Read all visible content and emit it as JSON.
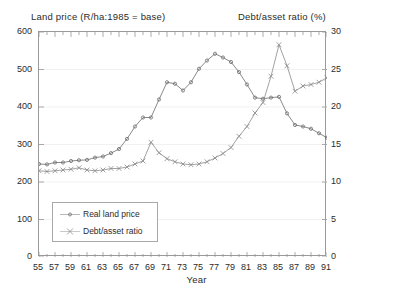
{
  "chart_data": {
    "type": "line",
    "title": "",
    "left_axis_title": "Land price (R/ha:1985 = base)",
    "right_axis_title": "Debt/asset ratio (%)",
    "xlabel": "Year",
    "ylabel": "Land price (R/ha:1985 = base)",
    "y2label": "Debt/asset ratio (%)",
    "ylim": [
      0,
      600
    ],
    "y2lim": [
      0,
      30
    ],
    "xlim": [
      55,
      91
    ],
    "grid": false,
    "legend_position": "lower-left-inside",
    "y_ticks": [
      "0",
      "100",
      "200",
      "300",
      "400",
      "500",
      "600"
    ],
    "y2_ticks": [
      "0",
      "5",
      "10",
      "15",
      "20",
      "25",
      "30"
    ],
    "x_ticks": [
      "55",
      "57",
      "59",
      "61",
      "63",
      "65",
      "67",
      "69",
      "71",
      "73",
      "75",
      "77",
      "79",
      "81",
      "83",
      "85",
      "87",
      "89",
      "91"
    ],
    "x_minor_tick_step": 1,
    "x": [
      55,
      56,
      57,
      58,
      59,
      60,
      61,
      62,
      63,
      64,
      65,
      66,
      67,
      68,
      69,
      70,
      71,
      72,
      73,
      74,
      75,
      76,
      77,
      78,
      79,
      80,
      81,
      82,
      83,
      84,
      85,
      86,
      87,
      88,
      89,
      90,
      91
    ],
    "series": [
      {
        "name": "Real land price",
        "axis": "left",
        "marker": "dot",
        "color": "#6b6b6b",
        "values": [
          248,
          247,
          252,
          252,
          256,
          258,
          259,
          265,
          268,
          277,
          288,
          315,
          348,
          372,
          372,
          420,
          466,
          462,
          444,
          466,
          502,
          524,
          542,
          532,
          520,
          493,
          460,
          425,
          422,
          425,
          427,
          383,
          352,
          348,
          342,
          330,
          318
        ]
      },
      {
        "name": "Debt/asset ratio",
        "axis": "right",
        "marker": "cross",
        "color": "#8a8a8a",
        "values": [
          11.5,
          11.4,
          11.5,
          11.6,
          11.7,
          11.9,
          11.6,
          11.5,
          11.6,
          11.8,
          11.8,
          12.0,
          12.4,
          12.8,
          15.3,
          13.9,
          13.1,
          12.7,
          12.4,
          12.3,
          12.4,
          12.7,
          13.2,
          13.8,
          14.6,
          16.1,
          17.4,
          19.2,
          20.6,
          24.1,
          28.3,
          25.5,
          22.1,
          22.8,
          23.0,
          23.3,
          23.9
        ]
      }
    ]
  },
  "legend": {
    "items": [
      {
        "label": "Real land price",
        "marker": "dot"
      },
      {
        "label": "Debt/asset ratio",
        "marker": "cross"
      }
    ]
  }
}
